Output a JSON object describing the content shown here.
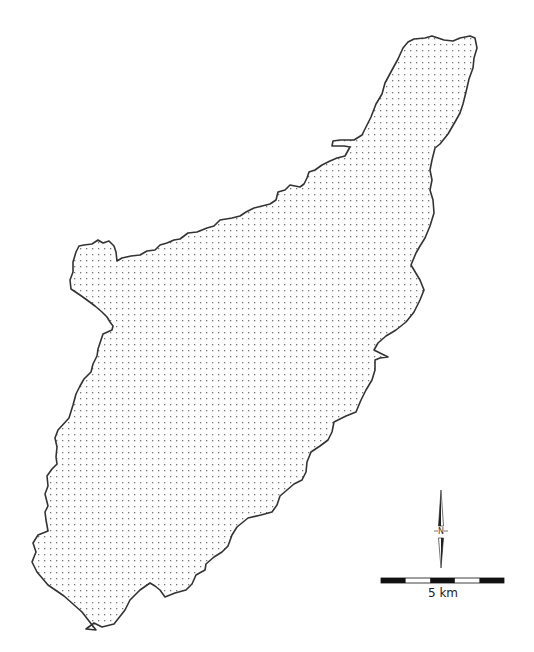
{
  "map": {
    "region_fill_pattern": "dotted",
    "colors": {
      "background": "#ffffff",
      "boundary": "#333333",
      "dots": "#777777",
      "scale_dark": "#111111",
      "scale_light": "#ffffff"
    },
    "boundary_path": "M 96 630 L 82 612 L 64 596 L 48 585 L 37 572 L 32 562 L 36 552 L 33 543 L 38 535 L 48 531 L 46 520 L 45 512 L 48 506 L 45 494 L 48 486 L 47 476 L 52 469 L 57 464 L 56 457 L 57 447 L 55 438 L 58 430 L 69 418 L 73 405 L 76 394 L 80 386 L 84 379 L 91 372 L 93 364 L 97 356 L 98 349 L 101 340 L 103 334 L 112 330 L 113 326 L 110 322 L 107 317 L 102 312 L 95 306 L 87 300 L 80 295 L 71 289 L 70 280 L 73 272 L 73 262 L 76 252 L 79 246 L 84 245 L 92 244 L 98 240 L 103 243 L 109 241 L 114 246 L 116 252 L 117 261 L 122 258 L 131 256 L 140 255 L 147 251 L 155 250 L 160 245 L 167 243 L 174 240 L 180 239 L 188 233 L 197 232 L 207 228 L 214 226 L 220 220 L 232 218 L 240 216 L 246 212 L 254 208 L 262 206 L 270 204 L 276 200 L 278 192 L 285 190 L 290 185 L 300 187 L 304 184 L 307 178 L 309 172 L 315 170 L 322 165 L 330 161 L 337 158 L 345 156 L 350 147 L 344 146 L 332 146 L 333 141 L 340 140 L 354 140 L 362 135 L 366 127 L 371 117 L 376 104 L 382 94 L 385 83 L 392 70 L 398 59 L 403 48 L 408 42 L 414 39 L 425 38 L 432 36 L 444 40 L 453 41 L 460 38 L 470 36 L 475 38 L 477 48 L 474 58 L 473 68 L 469 79 L 466 92 L 463 104 L 460 113 L 455 122 L 448 134 L 440 144 L 435 148 L 432 160 L 430 170 L 432 180 L 430 190 L 433 200 L 434 213 L 430 226 L 425 238 L 420 246 L 416 253 L 411 265 L 420 280 L 424 290 L 420 300 L 414 312 L 406 322 L 396 330 L 386 336 L 378 343 L 374 350 L 388 357 L 380 358 L 375 360 L 375 370 L 372 380 L 366 390 L 361 400 L 356 412 L 346 416 L 334 422 L 332 432 L 328 440 L 320 446 L 311 452 L 307 462 L 306 472 L 302 480 L 294 484 L 287 490 L 280 496 L 277 505 L 272 512 L 261 515 L 248 518 L 237 527 L 232 535 L 228 546 L 222 552 L 214 557 L 206 564 L 205 570 L 196 575 L 192 584 L 186 590 L 175 593 L 165 597 L 160 590 L 155 586 L 150 583 L 140 590 L 130 600 L 125 610 L 114 624 L 102 627 L 94 623 L 86 629 Z",
    "north_arrow": {
      "label": "N",
      "x": 441,
      "top": 490,
      "bottom": 568
    },
    "scale_bar": {
      "label": "5 km",
      "x_start": 381,
      "x_end": 504,
      "y": 579,
      "height": 4,
      "segments": 5
    }
  }
}
